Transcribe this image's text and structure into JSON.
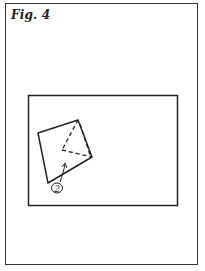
{
  "figure": {
    "label": "Fig. 4",
    "step_marker": "2"
  },
  "colors": {
    "ink": "#222222",
    "paper": "#ffffff"
  },
  "diagram": {
    "square_corners": [
      [
        38,
        133
      ],
      [
        78,
        120
      ],
      [
        92,
        157
      ],
      [
        48,
        183
      ]
    ],
    "fold_triangle": [
      [
        78,
        120
      ],
      [
        62,
        150
      ],
      [
        92,
        157
      ]
    ],
    "arrow": {
      "from": [
        60,
        180
      ],
      "to": [
        65,
        164
      ]
    }
  }
}
